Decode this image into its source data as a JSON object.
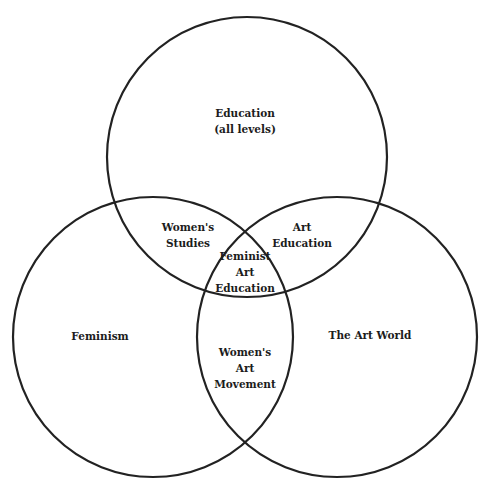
{
  "diagram": {
    "type": "venn",
    "stroke_color": "#222222",
    "background": "#ffffff",
    "circles": [
      {
        "id": "education",
        "label_lines": [
          "Education",
          "(all levels)"
        ],
        "cx": 247,
        "cy": 157,
        "r": 140
      },
      {
        "id": "feminism",
        "label_lines": [
          "Feminism"
        ],
        "cx": 153,
        "cy": 337,
        "r": 140
      },
      {
        "id": "art-world",
        "label_lines": [
          "The Art World"
        ],
        "cx": 337,
        "cy": 337,
        "r": 140
      }
    ],
    "intersections": [
      {
        "id": "womens-studies",
        "sets": [
          "education",
          "feminism"
        ],
        "label_lines": [
          "Women's",
          "Studies"
        ]
      },
      {
        "id": "art-education",
        "sets": [
          "education",
          "art-world"
        ],
        "label_lines": [
          "Art",
          "Education"
        ]
      },
      {
        "id": "womens-art-movement",
        "sets": [
          "feminism",
          "art-world"
        ],
        "label_lines": [
          "Women's",
          "Art",
          "Movement"
        ]
      },
      {
        "id": "feminist-art-education",
        "sets": [
          "education",
          "feminism",
          "art-world"
        ],
        "label_lines": [
          "Feminist",
          "Art",
          "Education"
        ]
      }
    ]
  }
}
